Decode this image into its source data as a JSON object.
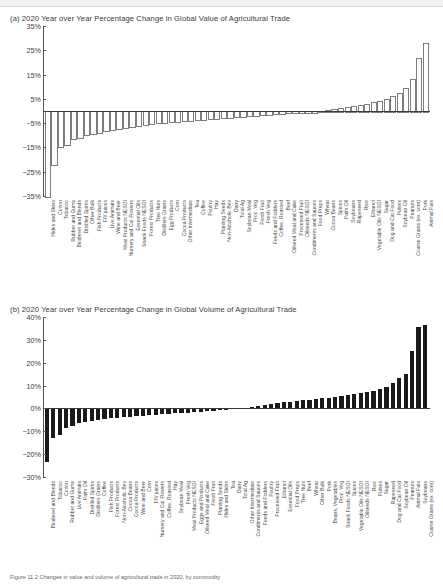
{
  "chart_data": [
    {
      "type": "bar",
      "panel": "a",
      "title": "(a)  2020 Year over Year Percentage Change in Global Value of Agricultural Trade",
      "xlabel": "",
      "ylabel": "",
      "ylim": [
        -35,
        35
      ],
      "yticks": [
        "35%",
        "25%",
        "15%",
        "5%",
        "−5%",
        "−15%",
        "−25%",
        "−35%"
      ],
      "ytickvalues": [
        35,
        25,
        15,
        5,
        -5,
        -15,
        -25,
        -35
      ],
      "grid": false,
      "legend": "none",
      "bar_style": "hollow-outline",
      "categories": [
        "Hides and Skins",
        "Cotton",
        "Tobacco",
        "Rubber and Gums",
        "Biodiesel and Blends",
        "Distilled Spirits",
        "Other Bulk",
        "Fish Products",
        "F/V juices",
        "Live Animals",
        "Wine and Beer",
        "Meat Products NESOI",
        "Nursery and Cut Flowers",
        "Essential Oils",
        "Snack Foods NESOI",
        "Forest Products",
        "Tree Nuts",
        "Distillers Grains",
        "Egg Products",
        "Corn",
        "Cocoa Products",
        "Other Intermediate",
        "Tea",
        "Coffee",
        "Poultry",
        "Hay",
        "Planting Seeds",
        "Non-Alcoholic Bev",
        "Dairy",
        "Total Ag",
        "Soybean Meal",
        "Proc. Veg",
        "Fresh Fruit",
        "Fresh Veg",
        "Feeds and Fodders",
        "Coffee, Roasted",
        "Beef",
        "Oilseed Meal and Cake",
        "Processed Fruit",
        "Oilseeds NESOI",
        "Condiments and Sauces",
        "Food Preps",
        "Wheat",
        "Cocoa Beans",
        "Spices",
        "Palm Oil",
        "Soybeans",
        "Rapeseed",
        "Rice",
        "Ethanol",
        "Vegetable Oils NESOI",
        "Sugar",
        "Dog and Cat Food",
        "Pulses",
        "Soybean Oil",
        "Peanuts",
        "Coarse Grains (ex. corn)",
        "Pork",
        "Animal Fats"
      ],
      "values": [
        -35.0,
        -22.0,
        -14.5,
        -13.5,
        -11.0,
        -10.5,
        -9.5,
        -9.0,
        -8.5,
        -8.0,
        -7.5,
        -7.0,
        -6.5,
        -6.0,
        -5.6,
        -5.3,
        -5.0,
        -4.7,
        -4.4,
        -4.2,
        -4.0,
        -3.8,
        -3.6,
        -3.4,
        -3.2,
        -3.0,
        -2.8,
        -2.6,
        -2.4,
        -2.2,
        -2.0,
        -1.8,
        -1.6,
        -1.4,
        -1.2,
        -1.0,
        -0.8,
        -0.6,
        -0.4,
        -0.3,
        -0.2,
        -0.1,
        0.2,
        0.5,
        0.8,
        1.2,
        1.6,
        2.0,
        2.5,
        3.0,
        3.6,
        4.2,
        5.0,
        6.0,
        7.5,
        9.5,
        13.0,
        22.0,
        28.0
      ]
    },
    {
      "type": "bar",
      "panel": "b",
      "title": "(b)  2020 Year over Year Percentage Change in Global Volume of Agricultural Trade",
      "xlabel": "",
      "ylabel": "",
      "ylim": [
        -30,
        40
      ],
      "yticks": [
        "40%",
        "30%",
        "20%",
        "10%",
        "0%",
        "−10%",
        "−20%",
        "−30%"
      ],
      "ytickvalues": [
        40,
        30,
        20,
        10,
        0,
        -10,
        -20,
        -30
      ],
      "grid": false,
      "legend": "none",
      "bar_style": "solid-black",
      "categories": [
        "Biodiesel and Blends",
        "Tobacco",
        "Cotton",
        "Rubber and Gums",
        "Live Animals",
        "Palm Oil",
        "Distilled Spirits",
        "Distillers Grains",
        "Coffee",
        "Fish Products",
        "Forest Products",
        "Non-Alcoholic Bev",
        "Cocoa Beans",
        "Cocoa Products",
        "Wine and Beer",
        "Corn",
        "F/V juices",
        "Nursery and Cut Flowers",
        "Coffee, Roasted",
        "Hay",
        "Soybean Meal",
        "Fresh Veg",
        "Meat Products NESOI",
        "Eggs and Products",
        "Oilseed Meal and Cake",
        "Fresh Fruit",
        "Planting Seeds",
        "Hides and Skins",
        "Tea",
        "Dairy",
        "Total Ag",
        "Other Intermediate",
        "Condiments and Sauces",
        "Feeds and Fodders",
        "Poultry",
        "Processed Fruit",
        "Ethanol",
        "Essential Oils",
        "Food Preps",
        "Tree Nuts",
        "Beef",
        "Wheat",
        "Other Bulk",
        "Pork",
        "Beans, Vegetables",
        "Proc. Veg",
        "Snack Foods NESOI",
        "Spices",
        "Vegetable Oils NESOI",
        "Oilseeds NESOI",
        "Rice",
        "Pulses",
        "Sugar",
        "Rapeseed",
        "Dog and Cat Food",
        "Soybean Oil",
        "Peanuts",
        "Animal Fats",
        "Soybeans",
        "Coarse Grains (ex. corn)"
      ],
      "values": [
        -23.5,
        -13.0,
        -11.5,
        -8.5,
        -7.5,
        -6.5,
        -6.0,
        -5.5,
        -5.0,
        -4.7,
        -4.4,
        -4.1,
        -3.8,
        -3.6,
        -3.4,
        -3.2,
        -3.0,
        -2.8,
        -2.6,
        -2.4,
        -2.2,
        -2.0,
        -1.8,
        -1.6,
        -1.4,
        -1.2,
        -1.0,
        -0.8,
        -0.6,
        -0.4,
        -0.2,
        0.3,
        0.8,
        1.2,
        1.6,
        2.0,
        2.3,
        2.6,
        2.9,
        3.2,
        3.5,
        3.8,
        4.1,
        4.4,
        4.7,
        5.0,
        5.4,
        5.8,
        6.2,
        6.6,
        7.0,
        7.5,
        8.5,
        9.5,
        11.0,
        13.5,
        15.0,
        25.0,
        35.5,
        36.5
      ]
    }
  ],
  "caption": "Figure 11.2  Changes in value and volume of agricultural trade in 2020, by commodity"
}
